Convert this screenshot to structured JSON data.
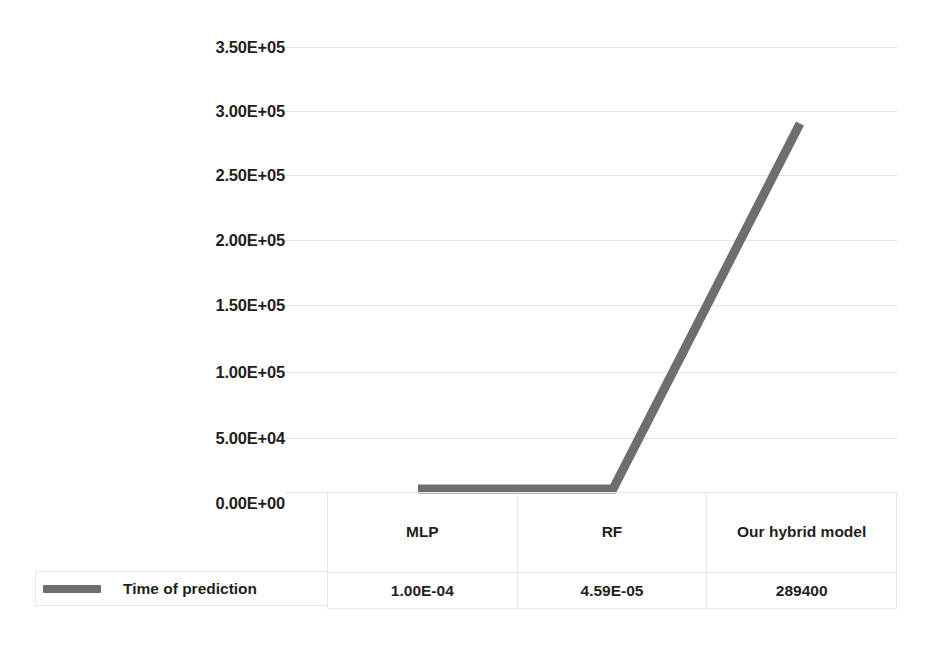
{
  "chart_data": {
    "type": "line",
    "title": "",
    "xlabel": "",
    "ylabel": "",
    "categories": [
      "MLP",
      "RF",
      "Our hybrid model"
    ],
    "series": [
      {
        "name": "Time of prediction",
        "values": [
          0.0001,
          4.59e-05,
          289400
        ],
        "value_labels": [
          "1.00E-04",
          "4.59E-05",
          "289400"
        ],
        "color": "#6E6E6E"
      }
    ],
    "ylim": [
      0,
      350000
    ],
    "yticks": [
      0,
      50000,
      100000,
      150000,
      200000,
      250000,
      300000,
      350000
    ],
    "ytick_labels": [
      "0.00E+00",
      "5.00E+04",
      "1.00E+05",
      "1.50E+05",
      "2.00E+05",
      "2.50E+05",
      "3.00E+05",
      "3.50E+05"
    ],
    "grid": true,
    "legend_position": "bottom-left"
  },
  "legend": {
    "label": "Time of prediction",
    "swatch_color": "#6E6E6E"
  },
  "data_table": {
    "column_headers": [
      "MLP",
      "RF",
      "Our hybrid model"
    ],
    "rows": [
      {
        "label": "Time of prediction",
        "cells": [
          "1.00E-04",
          "4.59E-05",
          "289400"
        ]
      }
    ]
  },
  "colors": {
    "series_line": "#6E6E6E",
    "gridline": "#e3e3e3",
    "table_border": "#e6e6e6",
    "text": "#1f1f1f",
    "background": "#ffffff"
  }
}
